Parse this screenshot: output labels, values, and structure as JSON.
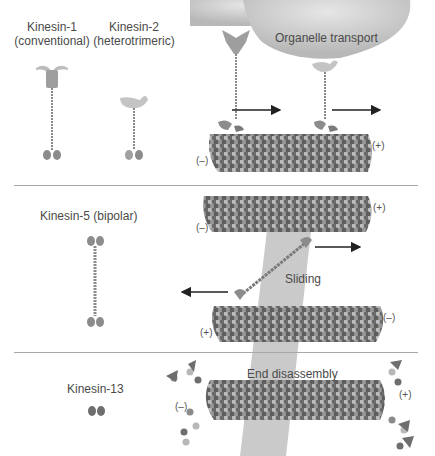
{
  "figure": {
    "panels": [
      {
        "id": "transport",
        "motors": [
          {
            "name": "Kinesin-1",
            "subtitle": "(conventional)"
          },
          {
            "name": "Kinesin-2",
            "subtitle": "(heterotrimeric)"
          }
        ],
        "cargo_label": "Organelle transport",
        "polarity_plus": "(+)",
        "polarity_minus": "(–)"
      },
      {
        "id": "sliding",
        "motor": "Kinesin-5 (bipolar)",
        "process_label": "Sliding",
        "top_mt": {
          "plus": "(+)",
          "minus": "(–)"
        },
        "bottom_mt": {
          "plus": "(+)",
          "minus": "(–)"
        }
      },
      {
        "id": "disassembly",
        "motor": "Kinesin-13",
        "process_label": "End disassembly",
        "polarity_plus": "(+)",
        "polarity_minus": "(–)"
      }
    ],
    "colors": {
      "tubulin_light": "#bcbcbc",
      "tubulin_dark": "#6e6e6e",
      "tubulin_mid": "#8f8f8f",
      "cargo": "#c9c9c9",
      "highlight_band": "#b5b5b5",
      "divider": "#a8a8a8",
      "arrow": "#222222"
    }
  }
}
